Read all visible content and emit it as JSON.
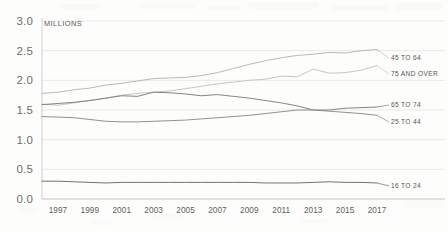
{
  "chart_data": {
    "type": "line",
    "title": "",
    "subtitle": "",
    "xlabel": "",
    "ylabel": "MILLIONS",
    "unit_label": "MILLIONS",
    "xlim": [
      1996,
      2017
    ],
    "ylim": [
      0.0,
      3.0
    ],
    "grid": true,
    "legend_position": "right-inline-labels",
    "y_ticks": [
      "3.0",
      "2.5",
      "2.0",
      "1.5",
      "1.0",
      "0.5",
      "0.0"
    ],
    "y_tick_values": [
      3.0,
      2.5,
      2.0,
      1.5,
      1.0,
      0.5,
      0.0
    ],
    "x_ticks": [
      "1997",
      "1999",
      "2001",
      "2003",
      "2005",
      "2007",
      "2009",
      "2011",
      "2013",
      "2015",
      "2017"
    ],
    "x_tick_values": [
      1997,
      1999,
      2001,
      2003,
      2005,
      2007,
      2009,
      2011,
      2013,
      2015,
      2017
    ],
    "x": [
      1996,
      1997,
      1998,
      1999,
      2000,
      2001,
      2002,
      2003,
      2004,
      2005,
      2006,
      2007,
      2008,
      2009,
      2010,
      2011,
      2012,
      2013,
      2014,
      2015,
      2016,
      2017
    ],
    "series": [
      {
        "name": "45 TO 64",
        "label": "45 TO 64",
        "color": "#b9b9b7",
        "width": 1.0,
        "values": [
          1.78,
          1.8,
          1.84,
          1.87,
          1.92,
          1.95,
          1.99,
          2.03,
          2.04,
          2.05,
          2.08,
          2.13,
          2.2,
          2.27,
          2.33,
          2.38,
          2.42,
          2.44,
          2.47,
          2.46,
          2.5,
          2.52
        ]
      },
      {
        "name": "75 AND OVER",
        "label": "75 AND OVER",
        "color": "#c6c6c4",
        "width": 1.0,
        "values": [
          1.6,
          1.58,
          1.62,
          1.66,
          1.7,
          1.75,
          1.78,
          1.8,
          1.82,
          1.86,
          1.9,
          1.94,
          1.97,
          2.0,
          2.02,
          2.07,
          2.06,
          2.19,
          2.12,
          2.13,
          2.17,
          2.25
        ]
      },
      {
        "name": "65 TO 74",
        "label": "65 TO 74",
        "color": "#7d7d7b",
        "width": 0.95,
        "values": [
          1.59,
          1.61,
          1.63,
          1.66,
          1.7,
          1.74,
          1.73,
          1.8,
          1.79,
          1.77,
          1.74,
          1.76,
          1.73,
          1.7,
          1.66,
          1.62,
          1.57,
          1.5,
          1.5,
          1.53,
          1.54,
          1.55
        ]
      },
      {
        "name": "25 TO 44",
        "label": "25 TO 44",
        "color": "#8a8a88",
        "width": 0.95,
        "values": [
          1.39,
          1.38,
          1.37,
          1.34,
          1.31,
          1.3,
          1.3,
          1.31,
          1.32,
          1.33,
          1.35,
          1.37,
          1.39,
          1.41,
          1.44,
          1.47,
          1.5,
          1.5,
          1.48,
          1.46,
          1.44,
          1.41
        ]
      },
      {
        "name": "16 TO 24",
        "label": "16 TO 24",
        "color": "#6b6b69",
        "width": 0.95,
        "values": [
          0.3,
          0.3,
          0.29,
          0.28,
          0.27,
          0.28,
          0.28,
          0.28,
          0.28,
          0.28,
          0.28,
          0.28,
          0.28,
          0.28,
          0.27,
          0.27,
          0.27,
          0.28,
          0.29,
          0.28,
          0.28,
          0.27
        ]
      }
    ]
  },
  "colors": {
    "background": "#fdfdfc",
    "gridline": "#e3e3e1",
    "axis": "#c9c9c7",
    "tick_text": "#6e6e6e",
    "label_text": "#555555"
  }
}
